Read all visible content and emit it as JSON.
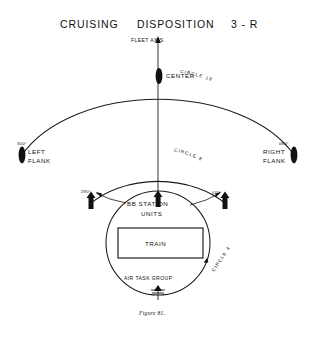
{
  "figure": {
    "title": {
      "word1": "CRUISING",
      "word2": "DISPOSITION",
      "word3": "3 - R"
    },
    "caption": "Figure 81.",
    "axis_label": "FLEET AXIS",
    "colors": {
      "ink": "#111111",
      "paper": "#ffffff"
    },
    "rings": [
      {
        "name": "circle-18",
        "label": "CIRCLE  18"
      },
      {
        "name": "circle-8",
        "label": "CIRCLE  8"
      },
      {
        "name": "circle-4",
        "label": "CIRCLE 4"
      }
    ],
    "stations": {
      "center": "CENTER",
      "left_flank_bearing": "300°",
      "left_flank_name_line1": "LEFT",
      "left_flank_name_line2": "FLANK",
      "right_flank_bearing": "080°",
      "right_flank_name_line1": "RIGHT",
      "right_flank_name_line2": "FLANK",
      "bb_station_line1": "BB  STATION",
      "bb_station_line2": "UNITS",
      "bb_left_bearing": "290°",
      "bb_right_bearing": "070°",
      "train": "TRAIN",
      "air_task_group": "AIR  TASK  GROUP"
    }
  }
}
